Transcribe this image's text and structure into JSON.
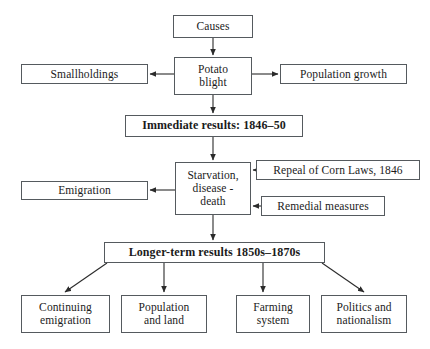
{
  "diagram": {
    "title_text": "",
    "style": {
      "border_color": "#555a5e",
      "text_color": "#1b1b1b",
      "background": "#ffffff",
      "edge_color": "#2b2b2b"
    },
    "nodes": {
      "causes": {
        "label": "Causes",
        "bold": false
      },
      "potato_blight": {
        "label": "Potato\nblight",
        "bold": false
      },
      "smallholdings": {
        "label": "Smallholdings",
        "bold": false
      },
      "population_growth": {
        "label": "Population growth",
        "bold": false
      },
      "immediate_results": {
        "label": "Immediate results: 1846–50",
        "bold": true
      },
      "starvation": {
        "label": "Starvation,\ndisease -\ndeath",
        "bold": false
      },
      "repeal_corn_laws": {
        "label": "Repeal of Corn Laws, 1846",
        "bold": false
      },
      "remedial_measures": {
        "label": "Remedial measures",
        "bold": false
      },
      "emigration": {
        "label": "Emigration",
        "bold": false
      },
      "longer_term_results": {
        "label": "Longer-term results 1850s–1870s",
        "bold": true
      },
      "continuing_emigration": {
        "label": "Continuing\nemigration",
        "bold": false
      },
      "population_and_land": {
        "label": "Population\nand land",
        "bold": false
      },
      "farming_system": {
        "label": "Farming\nsystem",
        "bold": false
      },
      "politics_nationalism": {
        "label": "Politics and\nnationalism",
        "bold": false
      }
    },
    "edges": [
      {
        "from": "causes",
        "to": "potato_blight",
        "direction": "down",
        "arrow": true
      },
      {
        "from": "potato_blight",
        "to": "smallholdings",
        "direction": "left",
        "arrow": true
      },
      {
        "from": "potato_blight",
        "to": "population_growth",
        "direction": "right",
        "arrow": true
      },
      {
        "from": "potato_blight",
        "to": "immediate_results",
        "direction": "down",
        "arrow": true
      },
      {
        "from": "immediate_results",
        "to": "starvation",
        "direction": "down",
        "arrow": true
      },
      {
        "from": "repeal_corn_laws",
        "to": "starvation",
        "direction": "left",
        "arrow": true
      },
      {
        "from": "remedial_measures",
        "to": "starvation",
        "direction": "left",
        "arrow": true
      },
      {
        "from": "starvation",
        "to": "emigration",
        "direction": "left",
        "arrow": true
      },
      {
        "from": "starvation",
        "to": "longer_term_results",
        "direction": "down",
        "arrow": true
      },
      {
        "from": "longer_term_results",
        "to": "continuing_emigration",
        "direction": "down-left",
        "arrow": true
      },
      {
        "from": "longer_term_results",
        "to": "population_and_land",
        "direction": "down",
        "arrow": true
      },
      {
        "from": "longer_term_results",
        "to": "farming_system",
        "direction": "down",
        "arrow": true
      },
      {
        "from": "longer_term_results",
        "to": "politics_nationalism",
        "direction": "down-right",
        "arrow": true
      }
    ]
  }
}
